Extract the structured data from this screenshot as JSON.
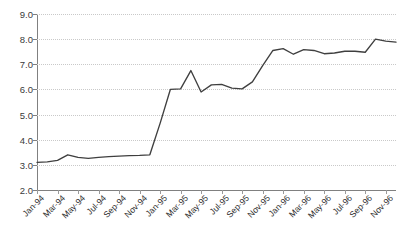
{
  "chart_data": {
    "type": "line",
    "title": "",
    "subtitle": "",
    "xlabel": "",
    "ylabel": "",
    "grid": true,
    "legend": false,
    "legend_position": "none",
    "ylim": [
      2.0,
      9.0
    ],
    "ytick_step": 1.0,
    "ytick_labels": [
      "9.0",
      "8.0",
      "7.0",
      "6.0",
      "5.0",
      "4.0",
      "3.0",
      "2.0"
    ],
    "ytick_values": [
      9.0,
      8.0,
      7.0,
      6.0,
      5.0,
      4.0,
      3.0,
      2.0
    ],
    "xtick_labels": [
      "Jan-94",
      "Mar-94",
      "May-94",
      "Jul-94",
      "Sep-94",
      "Nov-94",
      "Jan-95",
      "Mar-95",
      "May-95",
      "Jul-95",
      "Sep-95",
      "Nov-95",
      "Jan-96",
      "Mar-96",
      "May-96",
      "Jul-96",
      "Sep-96",
      "Nov-96"
    ],
    "xtick_interval_months": 2,
    "x": [
      "Jan-94",
      "Feb-94",
      "Mar-94",
      "Apr-94",
      "May-94",
      "Jun-94",
      "Jul-94",
      "Aug-94",
      "Sep-94",
      "Oct-94",
      "Nov-94",
      "Dec-94",
      "Jan-95",
      "Feb-95",
      "Mar-95",
      "Apr-95",
      "May-95",
      "Jun-95",
      "Jul-95",
      "Aug-95",
      "Sep-95",
      "Oct-95",
      "Nov-95",
      "Dec-95",
      "Jan-96",
      "Feb-96",
      "Mar-96",
      "Apr-96",
      "May-96",
      "Jun-96",
      "Jul-96",
      "Aug-96",
      "Sep-96",
      "Oct-96",
      "Nov-96",
      "Dec-96"
    ],
    "values": [
      3.1,
      3.12,
      3.18,
      3.4,
      3.3,
      3.26,
      3.3,
      3.33,
      3.35,
      3.37,
      3.38,
      3.4,
      4.65,
      6.0,
      6.02,
      6.75,
      5.9,
      6.18,
      6.2,
      6.05,
      6.02,
      6.3,
      6.95,
      7.55,
      7.62,
      7.4,
      7.58,
      7.55,
      7.42,
      7.45,
      7.52,
      7.52,
      7.48,
      8.0,
      7.92,
      7.88
    ],
    "series_color": "#3f3f3f",
    "grid_color": "#c9c9c9",
    "axis_color": "#808080"
  }
}
